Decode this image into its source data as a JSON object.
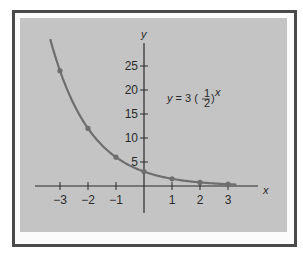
{
  "chart_data": {
    "type": "line",
    "title": "",
    "annotation": "y = 3 (1/2)^x",
    "equation": {
      "lhs": "y",
      "eq": "=",
      "coef": "3",
      "base_num": "1",
      "base_den": "2",
      "exponent": "x"
    },
    "xlabel": "x",
    "ylabel": "y",
    "xlim": [
      -4,
      4
    ],
    "ylim": [
      -5,
      29
    ],
    "grid": false,
    "x_ticks": [
      -3,
      -2,
      -1,
      1,
      2,
      3
    ],
    "x_tick_labels": [
      "−3",
      "−2",
      "−1",
      "1",
      "2",
      "3"
    ],
    "y_ticks": [
      5,
      10,
      15,
      20,
      25
    ],
    "y_tick_labels": [
      "5",
      "10",
      "15",
      "20",
      "25"
    ],
    "series": [
      {
        "name": "y = 3 (1/2)^x",
        "x": [
          -3,
          -2,
          -1,
          0,
          1,
          2,
          3
        ],
        "values": [
          24,
          12,
          6,
          3,
          1.5,
          0.75,
          0.375
        ],
        "color": "#6e6e6e",
        "markers": true
      }
    ]
  },
  "colors": {
    "frame": "#4a4a4a",
    "panel": "#c4c4c4",
    "axis": "#2a2a2a",
    "curve": "#6e6e6e"
  }
}
